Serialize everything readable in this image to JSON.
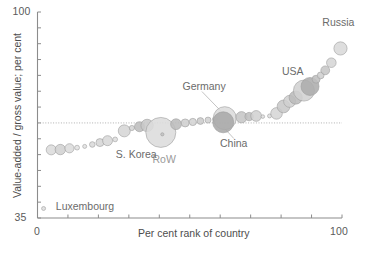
{
  "chart_data": {
    "type": "scatter",
    "title": "",
    "xlabel": "Per cent rank of country",
    "ylabel": "Value-added / gross value; per cent",
    "xlim": [
      0,
      100
    ],
    "ylim": [
      35,
      100
    ],
    "xticks": [
      0,
      10,
      20,
      30,
      40,
      50,
      60,
      70,
      80,
      90,
      100
    ],
    "xtick_labels_shown": [
      "0",
      "100"
    ],
    "yticks": [
      35,
      40,
      45,
      50,
      55,
      60,
      65,
      70,
      75,
      80,
      85,
      90,
      95,
      100
    ],
    "ytick_labels_shown": [
      "35",
      "100"
    ],
    "grid": false,
    "reference_line": {
      "orientation": "horizontal",
      "y": 65,
      "style": "dotted"
    },
    "legend": "none",
    "marker": "bubble",
    "note": "Bubble size encodes country gross value; x is per cent rank, y is value-added share",
    "points": [
      {
        "label": "Luxembourg",
        "x": 2.0,
        "y": 38.0,
        "r": 2.0,
        "fill": "#dedede",
        "labeled": true
      },
      {
        "label": "",
        "x": 4.5,
        "y": 56.5,
        "r": 5.0,
        "fill": "#dcdcdc",
        "labeled": false
      },
      {
        "label": "",
        "x": 7.5,
        "y": 56.6,
        "r": 5.2,
        "fill": "#d2d2d2",
        "labeled": false
      },
      {
        "label": "",
        "x": 10.5,
        "y": 57.0,
        "r": 4.6,
        "fill": "#dcdcdc",
        "labeled": false
      },
      {
        "label": "",
        "x": 13.0,
        "y": 57.2,
        "r": 2.4,
        "fill": "#e2e2e2",
        "labeled": false
      },
      {
        "label": "",
        "x": 15.5,
        "y": 57.6,
        "r": 2.0,
        "fill": "#e2e2e2",
        "labeled": false
      },
      {
        "label": "",
        "x": 18.0,
        "y": 58.2,
        "r": 2.8,
        "fill": "#dadada",
        "labeled": false
      },
      {
        "label": "",
        "x": 20.5,
        "y": 58.8,
        "r": 4.0,
        "fill": "#d6d6d6",
        "labeled": false
      },
      {
        "label": "",
        "x": 23.0,
        "y": 59.4,
        "r": 5.0,
        "fill": "#d8d8d8",
        "labeled": false
      },
      {
        "label": "",
        "x": 25.5,
        "y": 59.8,
        "r": 2.4,
        "fill": "#dedede",
        "labeled": false
      },
      {
        "label": "S. Korea",
        "x": 28.5,
        "y": 62.5,
        "r": 6.0,
        "fill": "#d6d6d6",
        "labeled": true
      },
      {
        "label": "",
        "x": 31.0,
        "y": 63.4,
        "r": 2.6,
        "fill": "#d4d4d4",
        "labeled": false
      },
      {
        "label": "",
        "x": 33.5,
        "y": 63.8,
        "r": 5.0,
        "fill": "#bdbdbd",
        "labeled": false
      },
      {
        "label": "",
        "x": 36.0,
        "y": 64.2,
        "r": 6.2,
        "fill": "#c8c8c8",
        "labeled": false
      },
      {
        "label": "RoW",
        "x": 40.5,
        "y": 62.0,
        "r": 15.0,
        "fill": "#dcdcdc",
        "labeled": true
      },
      {
        "label": "",
        "x": 41.0,
        "y": 61.4,
        "r": 1.6,
        "fill": "#c0c0c0",
        "labeled": false
      },
      {
        "label": "",
        "x": 45.5,
        "y": 64.6,
        "r": 5.4,
        "fill": "#bcbcbc",
        "labeled": false
      },
      {
        "label": "",
        "x": 48.5,
        "y": 65.0,
        "r": 4.0,
        "fill": "#cfcfcf",
        "labeled": false
      },
      {
        "label": "",
        "x": 51.0,
        "y": 65.3,
        "r": 3.6,
        "fill": "#d4d4d4",
        "labeled": false
      },
      {
        "label": "",
        "x": 53.5,
        "y": 65.6,
        "r": 3.4,
        "fill": "#cccccc",
        "labeled": false
      },
      {
        "label": "",
        "x": 56.0,
        "y": 65.9,
        "r": 3.0,
        "fill": "#d2d2d2",
        "labeled": false
      },
      {
        "label": "",
        "x": 58.2,
        "y": 66.2,
        "r": 2.2,
        "fill": "#d8d8d8",
        "labeled": false
      },
      {
        "label": "Germany",
        "x": 61.5,
        "y": 66.5,
        "r": 11.5,
        "fill": "#dcdcdc",
        "labeled": true
      },
      {
        "label": "China",
        "x": 61.0,
        "y": 65.2,
        "r": 10.5,
        "fill": "#a9a9a9",
        "labeled": true
      },
      {
        "label": "",
        "x": 67.0,
        "y": 66.8,
        "r": 5.6,
        "fill": "#c6c6c6",
        "labeled": false
      },
      {
        "label": "",
        "x": 69.5,
        "y": 67.0,
        "r": 4.2,
        "fill": "#bfbfbf",
        "labeled": false
      },
      {
        "label": "",
        "x": 71.8,
        "y": 67.2,
        "r": 5.4,
        "fill": "#d2d2d2",
        "labeled": false
      },
      {
        "label": "",
        "x": 74.0,
        "y": 67.0,
        "r": 1.8,
        "fill": "#e0e0e0",
        "labeled": false
      },
      {
        "label": "",
        "x": 76.2,
        "y": 67.2,
        "r": 2.0,
        "fill": "#e0e0e0",
        "labeled": false
      },
      {
        "label": "",
        "x": 78.5,
        "y": 68.0,
        "r": 5.8,
        "fill": "#d6d6d6",
        "labeled": false
      },
      {
        "label": "",
        "x": 80.8,
        "y": 70.2,
        "r": 6.4,
        "fill": "#c8c8c8",
        "labeled": false
      },
      {
        "label": "",
        "x": 82.8,
        "y": 71.8,
        "r": 6.0,
        "fill": "#d0d0d0",
        "labeled": false
      },
      {
        "label": "",
        "x": 84.8,
        "y": 73.0,
        "r": 6.6,
        "fill": "#bcbcbc",
        "labeled": false
      },
      {
        "label": "USA",
        "x": 87.5,
        "y": 75.2,
        "r": 10.5,
        "fill": "#d2d2d2",
        "labeled": true
      },
      {
        "label": "",
        "x": 89.5,
        "y": 76.5,
        "r": 9.0,
        "fill": "#adadad",
        "labeled": false
      },
      {
        "label": "",
        "x": 91.5,
        "y": 78.8,
        "r": 4.0,
        "fill": "#bfbfbf",
        "labeled": false
      },
      {
        "label": "",
        "x": 93.0,
        "y": 80.0,
        "r": 3.4,
        "fill": "#cfcfcf",
        "labeled": false
      },
      {
        "label": "",
        "x": 94.5,
        "y": 81.6,
        "r": 4.4,
        "fill": "#c6c6c6",
        "labeled": false
      },
      {
        "label": "",
        "x": 96.5,
        "y": 84.0,
        "r": 4.8,
        "fill": "#d6d6d6",
        "labeled": false
      },
      {
        "label": "Russia",
        "x": 99.5,
        "y": 88.5,
        "r": 6.6,
        "fill": "#dadada",
        "labeled": true
      }
    ],
    "annotations": [
      {
        "text": "Russia",
        "x": 99.0,
        "y": 96.0,
        "anchor": "middle",
        "leader": false
      },
      {
        "text": "USA",
        "x": 83.0,
        "y": 80.5,
        "anchor": "middle",
        "leader": false
      },
      {
        "text": "Germany",
        "x": 54.0,
        "y": 76.0,
        "anchor": "middle",
        "leader": true
      },
      {
        "text": "China",
        "x": 64.5,
        "y": 58.0,
        "anchor": "middle",
        "leader": true
      },
      {
        "text": "RoW",
        "x": 40.5,
        "y": 53.0,
        "anchor": "middle",
        "leader": false
      },
      {
        "text": "S. Korea",
        "x": 33.0,
        "y": 54.5,
        "anchor": "middle",
        "leader": false
      },
      {
        "text": "Luxembourg",
        "x": 6.0,
        "y": 38.0,
        "anchor": "start",
        "leader": false
      }
    ]
  },
  "axes": {
    "y_top_label": "100",
    "y_bottom_label": "35",
    "x_left_label": "0",
    "x_right_label": "100",
    "x_title": "Per cent rank of country",
    "y_title": "Value-added / gross value; per cent"
  },
  "colors": {
    "axis": "#8c8c8c",
    "text": "#555555",
    "label_text": "#6b6b6b",
    "dim_label_text": "#9a9a9a",
    "bubble_stroke": "#9e9e9e",
    "reference_line": "#b0b0b0",
    "background": "#ffffff"
  }
}
